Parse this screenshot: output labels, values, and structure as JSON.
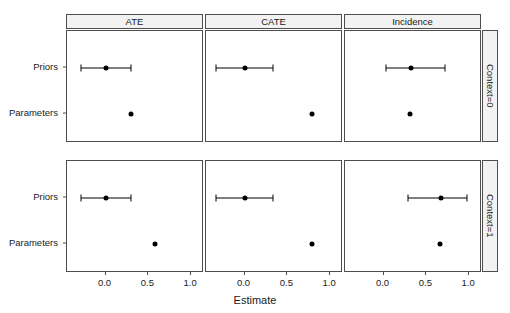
{
  "chart_data": {
    "type": "scatter",
    "title": "",
    "xlabel": "Estimate",
    "ylabel": "",
    "xlim": [
      -0.45,
      1.15
    ],
    "xticks": [
      0.0,
      0.5,
      1.0
    ],
    "xticklabels": [
      "0.0",
      "0.5",
      "1.0"
    ],
    "ycategories": [
      "Priors",
      "Parameters"
    ],
    "col_facets": [
      "ATE",
      "CATE",
      "Incidence"
    ],
    "row_facets": [
      "Context=0",
      "Context=1"
    ],
    "grid": false,
    "legend": "none",
    "point_color": "#000000",
    "panel_background": "#ffffff",
    "strip_background": "#f2f2f2",
    "panels": [
      {
        "col": "ATE",
        "row": "Context=0",
        "points": [
          {
            "y": "Priors",
            "estimate": 0.0,
            "low": -0.29,
            "high": 0.3,
            "has_interval": true
          },
          {
            "y": "Parameters",
            "estimate": 0.3,
            "has_interval": false
          }
        ]
      },
      {
        "col": "CATE",
        "row": "Context=0",
        "points": [
          {
            "y": "Priors",
            "estimate": 0.0,
            "low": -0.33,
            "high": 0.33,
            "has_interval": true
          },
          {
            "y": "Parameters",
            "estimate": 0.79,
            "has_interval": false
          }
        ]
      },
      {
        "col": "Incidence",
        "row": "Context=0",
        "points": [
          {
            "y": "Priors",
            "estimate": 0.32,
            "low": 0.03,
            "high": 0.72,
            "has_interval": true
          },
          {
            "y": "Parameters",
            "estimate": 0.31,
            "has_interval": false
          }
        ]
      },
      {
        "col": "ATE",
        "row": "Context=1",
        "points": [
          {
            "y": "Priors",
            "estimate": 0.0,
            "low": -0.29,
            "high": 0.3,
            "has_interval": true
          },
          {
            "y": "Parameters",
            "estimate": 0.58,
            "has_interval": false
          }
        ]
      },
      {
        "col": "CATE",
        "row": "Context=1",
        "points": [
          {
            "y": "Priors",
            "estimate": 0.0,
            "low": -0.33,
            "high": 0.33,
            "has_interval": true
          },
          {
            "y": "Parameters",
            "estimate": 0.79,
            "has_interval": false
          }
        ]
      },
      {
        "col": "Incidence",
        "row": "Context=1",
        "points": [
          {
            "y": "Priors",
            "estimate": 0.67,
            "low": 0.28,
            "high": 0.97,
            "has_interval": true
          },
          {
            "y": "Parameters",
            "estimate": 0.66,
            "has_interval": false
          }
        ]
      }
    ]
  }
}
